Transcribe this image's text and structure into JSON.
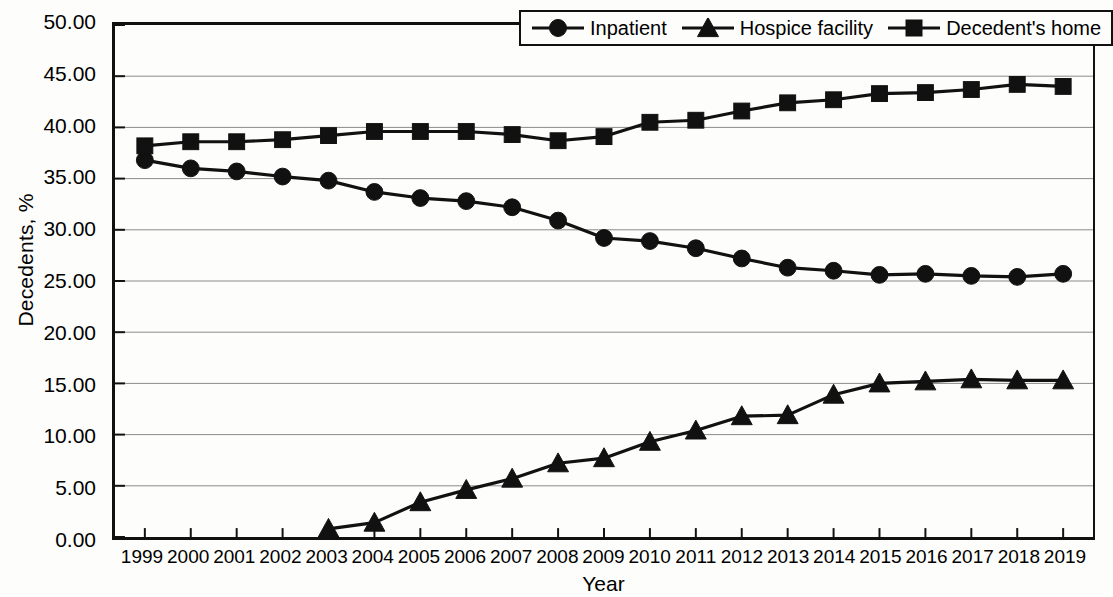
{
  "chart_data": {
    "type": "line",
    "title": "",
    "xlabel": "Year",
    "ylabel": "Decedents, %",
    "x": [
      1999,
      2000,
      2001,
      2002,
      2003,
      2004,
      2005,
      2006,
      2007,
      2008,
      2009,
      2010,
      2011,
      2012,
      2013,
      2014,
      2015,
      2016,
      2017,
      2018,
      2019
    ],
    "xtick_labels": [
      "1999",
      "2000",
      "2001",
      "2002",
      "2003",
      "2004",
      "2005",
      "2006",
      "2007",
      "2008",
      "2009",
      "2010",
      "2011",
      "2012",
      "2013",
      "2014",
      "2015",
      "2016",
      "2017",
      "2018",
      "2019"
    ],
    "ytick_labels": [
      "0.00",
      "5.00",
      "10.00",
      "15.00",
      "20.00",
      "25.00",
      "30.00",
      "35.00",
      "40.00",
      "45.00",
      "50.00"
    ],
    "ytick_values": [
      0,
      5,
      10,
      15,
      20,
      25,
      30,
      35,
      40,
      45,
      50
    ],
    "ylim": [
      0,
      50
    ],
    "xlim": [
      1999,
      2019
    ],
    "grid": "horizontal",
    "legend_position": "top-right-inside",
    "series": [
      {
        "name": "Inpatient",
        "marker": "circle",
        "color": "#111111",
        "values": [
          36.8,
          36.0,
          35.7,
          35.2,
          34.8,
          33.7,
          33.1,
          32.8,
          32.2,
          30.9,
          29.2,
          28.9,
          28.2,
          27.2,
          26.3,
          26.0,
          25.6,
          25.7,
          25.5,
          25.4,
          25.7
        ]
      },
      {
        "name": "Hospice facility",
        "marker": "triangle",
        "color": "#111111",
        "values": [
          null,
          null,
          null,
          null,
          0.8,
          1.4,
          3.4,
          4.6,
          5.7,
          7.2,
          7.7,
          9.3,
          10.4,
          11.8,
          11.9,
          13.9,
          15.0,
          15.2,
          15.4,
          15.3,
          15.3
        ]
      },
      {
        "name": "Decedent's home",
        "marker": "square",
        "color": "#111111",
        "values": [
          38.2,
          38.6,
          38.6,
          38.8,
          39.2,
          39.6,
          39.6,
          39.6,
          39.3,
          38.7,
          39.1,
          40.5,
          40.7,
          41.6,
          42.4,
          42.7,
          43.3,
          43.4,
          43.7,
          44.2,
          44.0
        ]
      }
    ]
  },
  "legend": {
    "items": [
      {
        "label": "Inpatient",
        "marker": "circle"
      },
      {
        "label": "Hospice facility",
        "marker": "triangle"
      },
      {
        "label": "Decedent's home",
        "marker": "square"
      }
    ]
  }
}
